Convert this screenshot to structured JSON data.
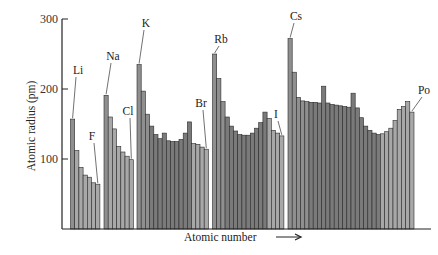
{
  "chart_data": {
    "type": "bar",
    "title": "",
    "xlabel": "Atomic number",
    "ylabel": "Atomic radius (pm)",
    "ylim": [
      0,
      300
    ],
    "yticks": [
      100,
      200,
      300
    ],
    "grid": false,
    "legend": null,
    "groups": [
      {
        "period": 2,
        "elements": [
          "Li",
          "Be",
          "B",
          "C",
          "N",
          "O",
          "F"
        ],
        "values": [
          157,
          112,
          88,
          77,
          74,
          66,
          64
        ],
        "label": {
          "text": "Li",
          "index": 0,
          "second": {
            "text": "F",
            "index": 6
          }
        }
      },
      {
        "period": 3,
        "elements": [
          "Na",
          "Mg",
          "Al",
          "Si",
          "P",
          "S",
          "Cl"
        ],
        "values": [
          191,
          160,
          143,
          118,
          110,
          104,
          99
        ],
        "label": {
          "text": "Na",
          "index": 0,
          "second": {
            "text": "Cl",
            "index": 6
          }
        }
      },
      {
        "period": 4,
        "elements": [
          "K",
          "Ca",
          "Sc",
          "Ti",
          "V",
          "Cr",
          "Mn",
          "Fe",
          "Co",
          "Ni",
          "Cu",
          "Zn",
          "Ga",
          "Ge",
          "As",
          "Se",
          "Br"
        ],
        "values": [
          235,
          197,
          164,
          147,
          135,
          129,
          137,
          126,
          125,
          125,
          128,
          137,
          153,
          122,
          121,
          117,
          114
        ],
        "label": {
          "text": "K",
          "index": 0,
          "second": {
            "text": "Br",
            "index": 16
          }
        }
      },
      {
        "period": 5,
        "elements": [
          "Rb",
          "Sr",
          "Y",
          "Zr",
          "Nb",
          "Mo",
          "Tc",
          "Ru",
          "Rh",
          "Pd",
          "Ag",
          "Cd",
          "In",
          "Sn",
          "Sb",
          "Te",
          "I"
        ],
        "values": [
          250,
          215,
          182,
          160,
          147,
          140,
          135,
          134,
          134,
          137,
          144,
          152,
          167,
          158,
          141,
          137,
          133
        ],
        "label": {
          "text": "Rb",
          "index": 0,
          "second": {
            "text": "I",
            "index": 16
          }
        }
      },
      {
        "period": 6,
        "elements": [
          "Cs",
          "Ba",
          "La",
          "Ce",
          "Pr",
          "Nd",
          "Pm",
          "Sm",
          "Eu",
          "Gd",
          "Tb",
          "Dy",
          "Ho",
          "Er",
          "Tm",
          "Yb",
          "Lu",
          "Hf",
          "Ta",
          "W",
          "Re",
          "Os",
          "Ir",
          "Pt",
          "Au",
          "Hg",
          "Tl",
          "Pb",
          "Bi",
          "Po"
        ],
        "values": [
          272,
          224,
          188,
          183,
          182,
          181,
          181,
          180,
          204,
          180,
          178,
          177,
          176,
          175,
          174,
          194,
          173,
          159,
          147,
          141,
          137,
          135,
          136,
          139,
          144,
          155,
          171,
          175,
          182,
          167
        ],
        "label": {
          "text": "Cs",
          "index": 0,
          "second": {
            "text": "Po",
            "index": 29
          }
        }
      }
    ]
  },
  "axis": {
    "y_title": "Atomic radius (pm)",
    "x_title": "Atomic number",
    "tick_labels": [
      "100",
      "200",
      "300"
    ]
  },
  "colors": {
    "bar_dark": "#7a7a7a",
    "bar_mid": "#8f8f8f",
    "bar_light": "#a8a8a8",
    "bar_edge": "#2a2a2a",
    "axis": "#222222"
  }
}
